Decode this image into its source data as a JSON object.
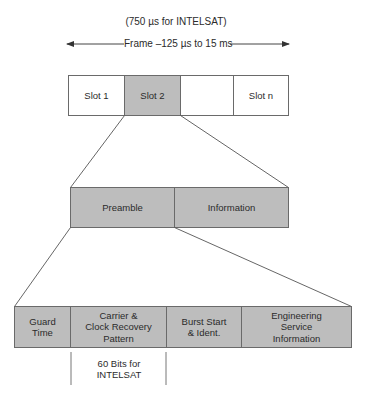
{
  "colors": {
    "line": "#555555",
    "box_border": "#6a6a6a",
    "fill_gray": "#bdbdbd",
    "fill_white": "#ffffff"
  },
  "frame": {
    "subtitle": "(750 µs for INTELSAT)",
    "label": "Frame –125 µs to 15 ms"
  },
  "slots": [
    {
      "label": "Slot 1",
      "highlighted": false
    },
    {
      "label": "Slot 2",
      "highlighted": true
    },
    {
      "label": "",
      "highlighted": false
    },
    {
      "label": "Slot n",
      "highlighted": false
    }
  ],
  "burst": [
    {
      "label": "Preamble"
    },
    {
      "label": "Information"
    }
  ],
  "preamble_fields": [
    {
      "label": "Guard\nTime"
    },
    {
      "label": "Carrier &\nClock Recovery\nPattern"
    },
    {
      "label": "Burst Start\n& Ident."
    },
    {
      "label": "Engineering\nService\nInformation"
    }
  ],
  "annotation": {
    "label": "60 Bits for\nINTELSAT"
  }
}
